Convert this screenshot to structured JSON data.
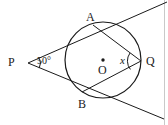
{
  "figure": {
    "width": 168,
    "height": 125,
    "background_color": "#ffffff",
    "stroke_color": "#1a1a1a",
    "border_color": "#c8c8c8"
  },
  "labels": {
    "point_p": "P",
    "point_a": "A",
    "point_b": "B",
    "point_q": "Q",
    "center_o": "O",
    "angle_at_p": "50°",
    "angle_at_q": "x"
  },
  "geometry": {
    "circle": {
      "cx": 103,
      "cy": 60,
      "r": 38
    },
    "points": {
      "P": {
        "x": 28,
        "y": 63
      },
      "A": {
        "x": 93,
        "y": 25
      },
      "B": {
        "x": 82,
        "y": 92
      },
      "Q": {
        "x": 141,
        "y": 61
      },
      "O": {
        "x": 103,
        "y": 60
      }
    },
    "tangent_line_through_A": {
      "x1": 28,
      "y1": 63,
      "x2": 166,
      "y2": 3
    },
    "tangent_line_through_B": {
      "x1": 28,
      "y1": 63,
      "x2": 163,
      "y2": 118
    },
    "chord_AQ": {
      "x1": 93,
      "y1": 25,
      "x2": 141,
      "y2": 61
    },
    "chord_BQ": {
      "x1": 82,
      "y1": 92,
      "x2": 141,
      "y2": 61
    },
    "angle_arc_p": {
      "cx": 28,
      "cy": 63,
      "r": 11
    },
    "angle_arc_q": {
      "cx": 141,
      "cy": 61,
      "r": 13
    }
  }
}
